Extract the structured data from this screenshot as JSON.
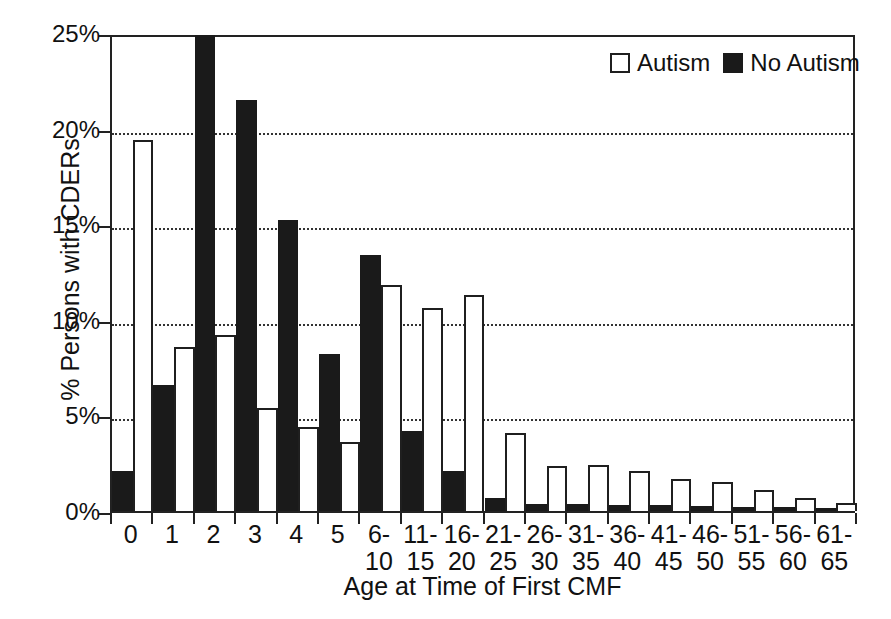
{
  "chart_data": {
    "type": "bar",
    "title": "",
    "xlabel": "Age at Time of First CMF",
    "ylabel": "% Persons with CDERs",
    "ylim": [
      0,
      25
    ],
    "yticks": [
      "0%",
      "5%",
      "10%",
      "15%",
      "20%",
      "25%"
    ],
    "ytick_values": [
      0,
      5,
      10,
      15,
      20,
      25
    ],
    "grid": "horizontal-dotted",
    "legend_position": "top-right",
    "categories": [
      "0",
      "1",
      "2",
      "3",
      "4",
      "5",
      "6-\n10",
      "11-\n15",
      "16-\n20",
      "21-\n25",
      "26-\n30",
      "31-\n35",
      "36-\n40",
      "41-\n45",
      "46-\n50",
      "51-\n55",
      "56-\n60",
      "61-\n65"
    ],
    "series": [
      {
        "name": "No Autism",
        "color": "#1a1a1a",
        "style": "filled",
        "values": [
          2.1,
          6.6,
          24.9,
          21.5,
          15.2,
          8.2,
          13.4,
          4.2,
          2.1,
          0.7,
          0.35,
          0.35,
          0.3,
          0.3,
          0.25,
          0.2,
          0.2,
          0.15
        ]
      },
      {
        "name": "Autism",
        "color": "#ffffff",
        "style": "open",
        "values": [
          19.4,
          8.6,
          9.2,
          5.4,
          4.4,
          3.6,
          11.8,
          10.6,
          11.3,
          4.1,
          2.35,
          2.4,
          2.1,
          1.7,
          1.5,
          1.1,
          0.7,
          0.4
        ]
      }
    ]
  },
  "legend": {
    "items": [
      {
        "label": "Autism",
        "style": "open"
      },
      {
        "label": "No Autism",
        "style": "filled"
      }
    ]
  },
  "colors": {
    "no_autism": "#1a1a1a",
    "autism_fill": "#ffffff",
    "outline": "#1f1f1f",
    "axis": "#222222",
    "grid": "#333333",
    "background": "#ffffff"
  }
}
